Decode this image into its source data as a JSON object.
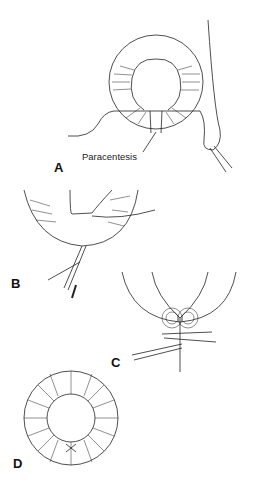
{
  "figure": {
    "panels": [
      {
        "label": "A",
        "annotation": "Paracentesis"
      },
      {
        "label": "B"
      },
      {
        "label": "C"
      },
      {
        "label": "D"
      }
    ]
  }
}
